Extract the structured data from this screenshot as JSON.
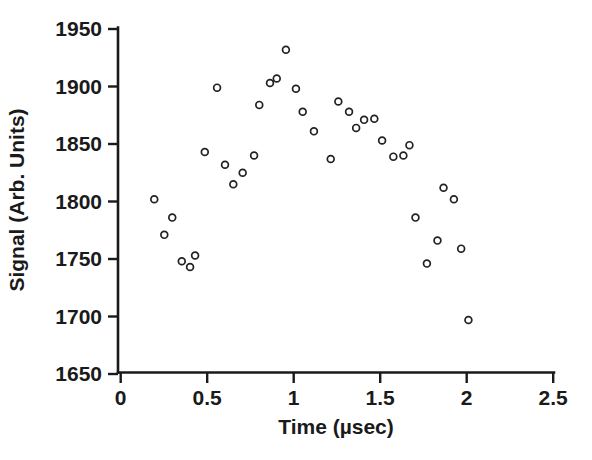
{
  "chart_data": {
    "type": "scatter",
    "title": "",
    "xlabel": "Time (µsec)",
    "ylabel": "Signal (Arb. Units)",
    "xlim": [
      0,
      2.5
    ],
    "ylim": [
      1650,
      1950
    ],
    "grid": false,
    "legend": null,
    "xticks": [
      0,
      0.5,
      1,
      1.5,
      2,
      2.5
    ],
    "xtick_labels": [
      "0",
      "0.5",
      "1",
      "1.5",
      "2",
      "2.5"
    ],
    "yticks": [
      1650,
      1700,
      1750,
      1800,
      1850,
      1900,
      1950
    ],
    "ytick_labels": [
      "1650",
      "1700",
      "1750",
      "1800",
      "1850",
      "1900",
      "1950"
    ],
    "marker": "open-circle",
    "marker_color": "#222222",
    "x": [
      0.194,
      0.252,
      0.298,
      0.353,
      0.401,
      0.43,
      0.486,
      0.557,
      0.603,
      0.651,
      0.705,
      0.771,
      0.801,
      0.863,
      0.902,
      0.955,
      1.013,
      1.052,
      1.117,
      1.214,
      1.258,
      1.32,
      1.361,
      1.407,
      1.466,
      1.511,
      1.576,
      1.634,
      1.669,
      1.704,
      1.77,
      1.831,
      1.866,
      1.926,
      1.968,
      2.01
    ],
    "y": [
      1802,
      1771,
      1786,
      1748,
      1743,
      1753,
      1843,
      1899,
      1832,
      1815,
      1825,
      1840,
      1884,
      1903,
      1907,
      1932,
      1898,
      1878,
      1861,
      1837,
      1887,
      1878,
      1864,
      1871,
      1872,
      1853,
      1839,
      1840,
      1849,
      1786,
      1746,
      1766,
      1812,
      1802,
      1759,
      1697
    ],
    "n_points": 36
  },
  "axes": {
    "x_axis_name": "time-axis",
    "y_axis_name": "signal-axis"
  }
}
